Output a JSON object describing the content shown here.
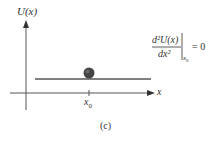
{
  "diagram": {
    "y_axis_label": "U(x)",
    "x_axis_label": "x",
    "tick_label": "x",
    "tick_label_sub": "0",
    "caption": "(c)",
    "formula": {
      "numerator": "d²U(x)",
      "denominator": "dx²",
      "evaluated_at": "x",
      "evaluated_at_sub": "0",
      "equals": "= 0"
    },
    "colors": {
      "axis": "#555555",
      "potential_line": "#555555",
      "ball": "#444444"
    }
  }
}
